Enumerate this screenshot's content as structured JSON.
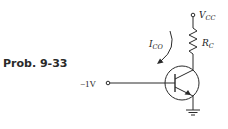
{
  "problem": {
    "label": "Prob. 9-33"
  },
  "circuit": {
    "supply": {
      "symbol": "V",
      "subscript": "CC"
    },
    "resistor": {
      "symbol": "R",
      "subscript": "C"
    },
    "current": {
      "symbol": "I",
      "subscript": "CO"
    },
    "input": {
      "label": "−1V"
    },
    "transistor": {
      "type": "NPN"
    },
    "ground": {
      "present": true
    }
  },
  "colors": {
    "line": "#2a2a2a",
    "background": "#ffffff"
  }
}
